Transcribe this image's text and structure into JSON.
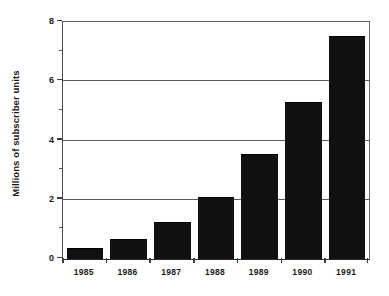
{
  "chart_data": {
    "type": "bar",
    "title": "",
    "subtitle": "",
    "xlabel": "",
    "ylabel": "Millions of subscriber units",
    "categories": [
      "1985",
      "1986",
      "1987",
      "1988",
      "1989",
      "1990",
      "1991"
    ],
    "values": [
      0.34,
      0.64,
      1.22,
      2.05,
      3.5,
      5.25,
      7.5
    ],
    "series": [
      {
        "name": "Subscriber units",
        "values": [
          0.34,
          0.64,
          1.22,
          2.05,
          3.5,
          5.25,
          7.5
        ]
      }
    ],
    "ylim": [
      0,
      8
    ],
    "y_major_ticks": [
      0,
      2,
      4,
      6,
      8
    ],
    "y_minor_ticks": [
      1,
      3,
      5,
      7
    ],
    "y_tick_labels": [
      "0",
      "2",
      "4",
      "6",
      "8"
    ],
    "gridlines": {
      "horizontal": [
        2,
        4,
        6,
        8
      ],
      "vertical": []
    },
    "grid": true,
    "legend": null,
    "legend_position": "none",
    "annotations": [],
    "bar_color": "#111111",
    "background_color": "#ffffff",
    "axis_color": "#3c3c3c",
    "grid_color": "#5a5a5a",
    "text_color": "#1a1a1a"
  }
}
